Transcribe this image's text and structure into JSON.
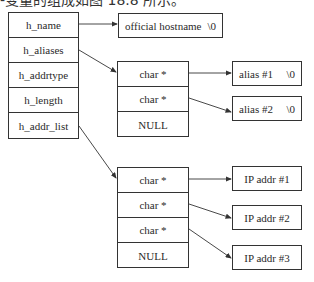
{
  "caption": "-变量的组成如图 18.8 所示。",
  "hostent": {
    "fields": [
      "h_name",
      "h_aliases",
      "h_addrtype",
      "h_length",
      "h_addr_list"
    ]
  },
  "hostname_box": {
    "label": "official hostname",
    "terminator": "\\0"
  },
  "aliases_array": {
    "cells": [
      "char *",
      "char *",
      "NULL"
    ]
  },
  "alias_strings": [
    {
      "label": "alias  #1",
      "terminator": "\\0"
    },
    {
      "label": "alias  #2",
      "terminator": "\\0"
    }
  ],
  "addr_array": {
    "cells": [
      "char *",
      "char *",
      "char *",
      "NULL"
    ]
  },
  "addr_entries": [
    {
      "label": "IP  addr  #1"
    },
    {
      "label": "IP  addr  #2"
    },
    {
      "label": "IP  addr  #3"
    }
  ],
  "colors": {
    "line": "#333333",
    "background": "#ffffff"
  }
}
